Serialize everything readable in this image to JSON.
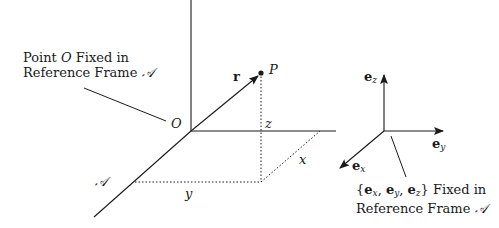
{
  "diagram": {
    "type": "3d-coordinate-frame",
    "origin_label": "O",
    "point_label": "P",
    "vector_label": "r",
    "coordinate_labels": {
      "x": "x",
      "y": "y",
      "z": "z"
    },
    "frame_label": "𝒜",
    "annotation_origin": {
      "line1": "Point",
      "var": "O",
      "line1_end": "Fixed in",
      "line2": "Reference Frame",
      "frame": "𝒜"
    },
    "basis": {
      "ex": "e",
      "ex_sub": "x",
      "ey": "e",
      "ey_sub": "y",
      "ez": "e",
      "ez_sub": "z"
    },
    "annotation_basis": {
      "set_open": "{",
      "set_close": "}",
      "line1_end": "Fixed in",
      "line2": "Reference Frame",
      "frame": "𝒜"
    },
    "colors": {
      "line": "#1a1a1a",
      "background": "#ffffff"
    }
  }
}
